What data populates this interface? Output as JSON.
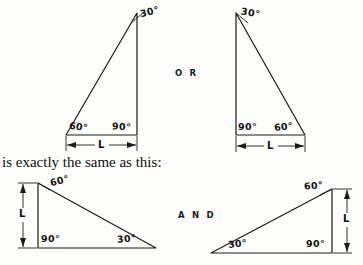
{
  "figure": {
    "caption": "is exactly the same as this:",
    "connectors": {
      "top": "O R",
      "bottom": "A N D"
    },
    "triangles": [
      {
        "id": "triangle-top-left",
        "angles": [
          "30°",
          "60°",
          "90°"
        ],
        "dimension_label": "L",
        "dimension_orientation": "horizontal",
        "apex_angle": "30°",
        "left_base_angle": "60°",
        "right_base_angle": "90°"
      },
      {
        "id": "triangle-top-right",
        "angles": [
          "30°",
          "90°",
          "60°"
        ],
        "dimension_label": "L",
        "dimension_orientation": "horizontal",
        "apex_angle": "30°",
        "left_base_angle": "90°",
        "right_base_angle": "60°"
      },
      {
        "id": "triangle-bottom-left",
        "angles": [
          "60°",
          "90°",
          "30°"
        ],
        "dimension_label": "L",
        "dimension_orientation": "vertical",
        "apex_angle": "60°",
        "left_base_angle": "90°",
        "right_base_angle": "30°"
      },
      {
        "id": "triangle-bottom-right",
        "angles": [
          "60°",
          "30°",
          "90°"
        ],
        "dimension_label": "L",
        "dimension_orientation": "vertical",
        "apex_angle": "60°",
        "left_base_angle": "30°",
        "right_base_angle": "90°"
      }
    ]
  }
}
